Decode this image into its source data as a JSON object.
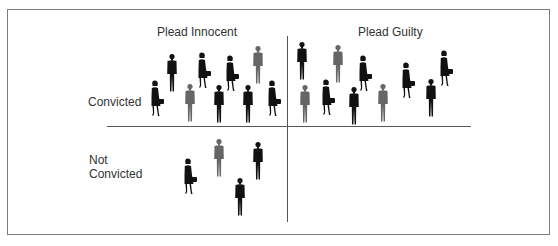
{
  "diagram": {
    "columns": [
      {
        "id": "innocent",
        "label": "Plead Innocent"
      },
      {
        "id": "guilty",
        "label": "Plead Guilty"
      }
    ],
    "rows": [
      {
        "id": "convicted",
        "label": "Convicted"
      },
      {
        "id": "not_convicted",
        "label": "Not Convicted"
      }
    ],
    "colors": {
      "frame": "#7a7a7a",
      "divider": "#555555",
      "figure_dark": "#111111",
      "figure_gray": "#666666"
    },
    "quadrants": {
      "innocent_convicted": {
        "count": 10,
        "women": 3,
        "men_black": 5,
        "men_gray": 2
      },
      "guilty_convicted": {
        "count": 11,
        "women": 4,
        "men_black": 4,
        "men_gray": 3
      },
      "innocent_not_convicted": {
        "count": 4,
        "women": 1,
        "men_black": 2,
        "men_gray": 1
      },
      "guilty_not_convicted": {
        "count": 0
      }
    }
  }
}
